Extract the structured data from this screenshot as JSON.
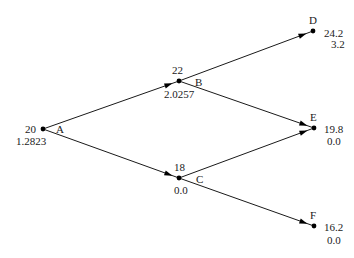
{
  "diagram": {
    "type": "binomial-tree",
    "nodes": [
      {
        "id": "A",
        "label": "A",
        "price": "20",
        "value": "1.2823"
      },
      {
        "id": "B",
        "label": "B",
        "price": "22",
        "value": "2.0257"
      },
      {
        "id": "C",
        "label": "C",
        "price": "18",
        "value": "0.0"
      },
      {
        "id": "D",
        "label": "D",
        "price": "24.2",
        "value": "3.2"
      },
      {
        "id": "E",
        "label": "E",
        "price": "19.8",
        "value": "0.0"
      },
      {
        "id": "F",
        "label": "F",
        "price": "16.2",
        "value": "0.0"
      }
    ],
    "edges": [
      {
        "from": "A",
        "to": "B"
      },
      {
        "from": "A",
        "to": "C"
      },
      {
        "from": "B",
        "to": "D"
      },
      {
        "from": "B",
        "to": "E"
      },
      {
        "from": "C",
        "to": "E"
      },
      {
        "from": "C",
        "to": "F"
      }
    ]
  }
}
